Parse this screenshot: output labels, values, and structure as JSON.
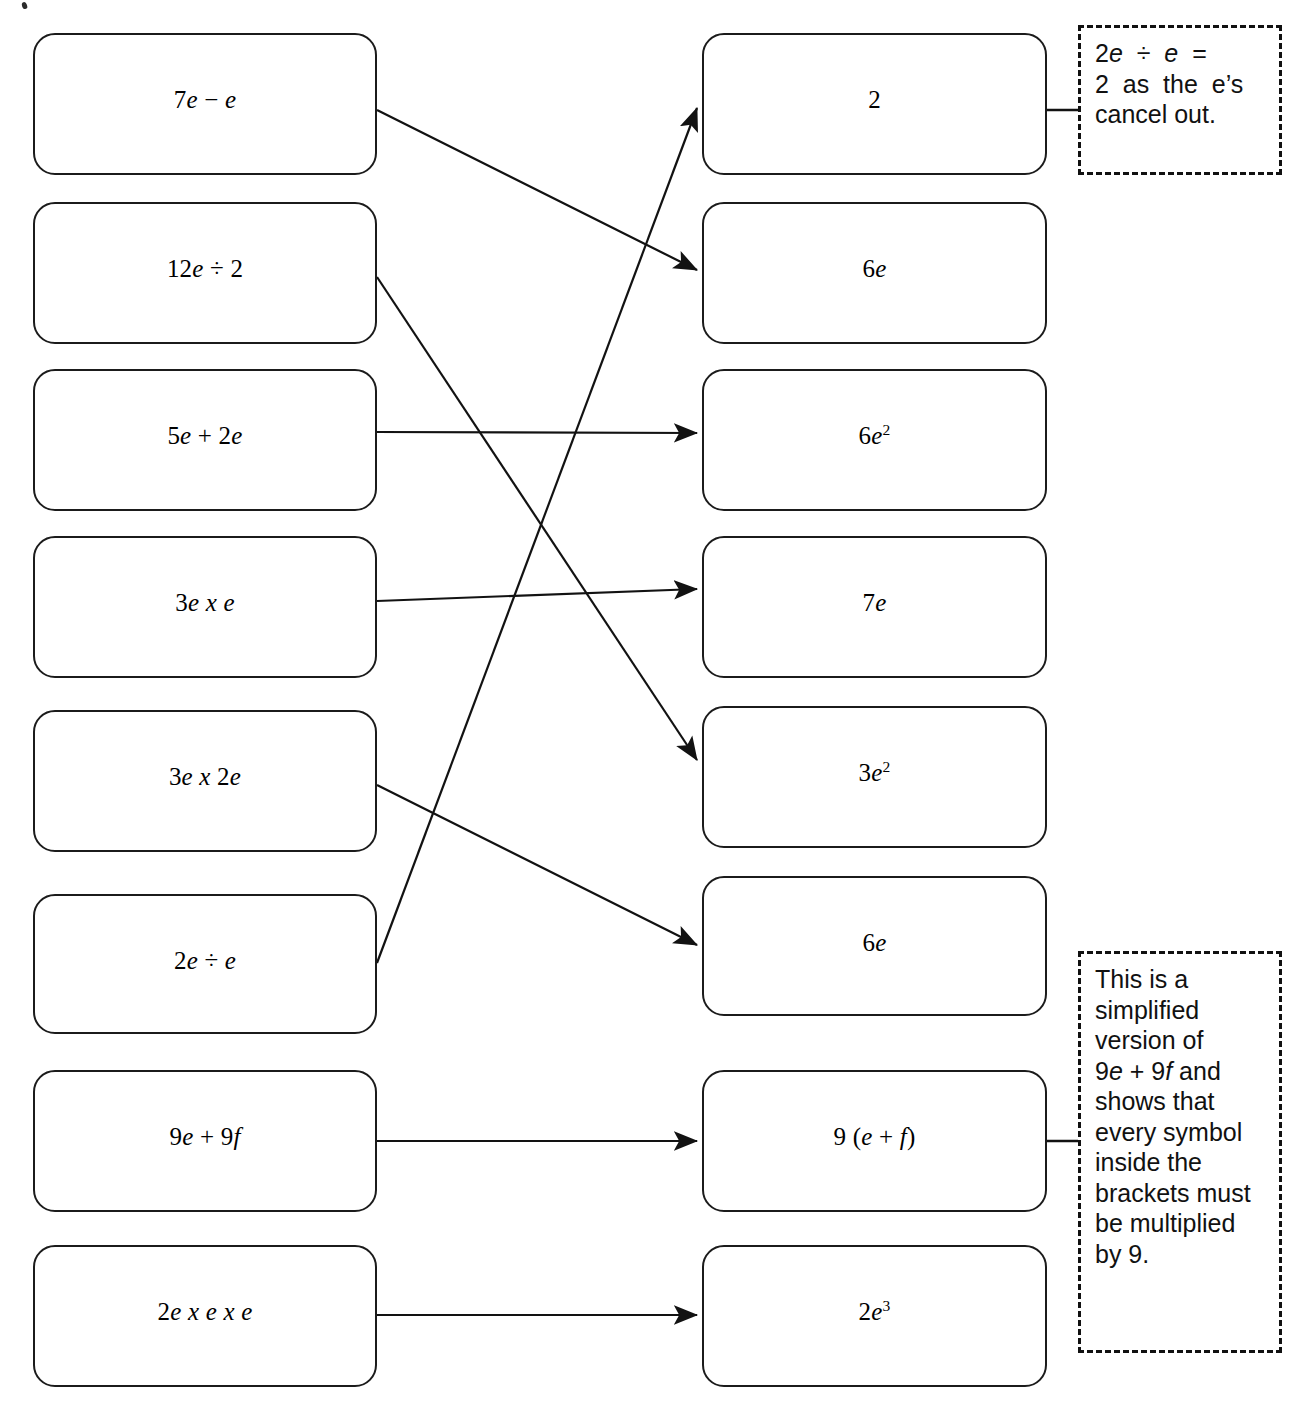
{
  "worksheet": {
    "left_column": [
      {
        "id": "l1",
        "text": "7e − e",
        "html": "7<i>e</i> − <i>e</i>"
      },
      {
        "id": "l2",
        "text": "12e ÷ 2",
        "html": "12<i>e</i> ÷ 2"
      },
      {
        "id": "l3",
        "text": "5e + 2e",
        "html": "5<i>e</i> + 2<i>e</i>"
      },
      {
        "id": "l4",
        "text": "3e x e",
        "html": "3<i>e</i> <i>x</i> <i>e</i>"
      },
      {
        "id": "l5",
        "text": "3e x 2e",
        "html": "3<i>e</i> <i>x</i> 2<i>e</i>"
      },
      {
        "id": "l6",
        "text": "2e ÷ e",
        "html": "2<i>e</i> ÷ <i>e</i>"
      },
      {
        "id": "l7",
        "text": "9e + 9f",
        "html": "9<i>e</i> + 9<i>f</i>"
      },
      {
        "id": "l8",
        "text": "2e x e x e",
        "html": "2<i>e</i> <i>x</i> <i>e</i> <i>x</i> <i>e</i>"
      }
    ],
    "right_column": [
      {
        "id": "r1",
        "text": "2",
        "html": "2"
      },
      {
        "id": "r2",
        "text": "6e",
        "html": "6<i>e</i>"
      },
      {
        "id": "r3",
        "text": "6e2",
        "html": "6<i>e</i><sup>2</sup>"
      },
      {
        "id": "r4",
        "text": "7e",
        "html": "7<i>e</i>"
      },
      {
        "id": "r5",
        "text": "3e2",
        "html": "3<i>e</i><sup>2</sup>"
      },
      {
        "id": "r6",
        "text": "6e",
        "html": "6<i>e</i>"
      },
      {
        "id": "r7",
        "text": "9 (e + f)",
        "html": "9 (<i>e</i> + <i>f</i>)"
      },
      {
        "id": "r8",
        "text": "2e3",
        "html": "2<i>e</i><sup>3</sup>"
      }
    ],
    "notes": [
      {
        "id": "note-top",
        "attached_to": "r1",
        "text": "2e ÷ e = 2 as the e's cancel out.",
        "lines": [
          {
            "html": "2<i>e</i>  ÷  <i>e</i>  ="
          },
          {
            "html": "2  as  the  e’s"
          },
          {
            "html": "cancel out."
          }
        ]
      },
      {
        "id": "note-bottom",
        "attached_to": "r7",
        "text": "This is a simplified version of 9e + 9f and shows that every symbol inside the brackets must be multiplied by 9.",
        "lines": [
          {
            "html": "This is a"
          },
          {
            "html": "simplified"
          },
          {
            "html": "version of"
          },
          {
            "html": "9<i>e</i> + 9<i>f</i> and"
          },
          {
            "html": "shows that"
          },
          {
            "html": "every symbol"
          },
          {
            "html": "inside the"
          },
          {
            "html": "brackets must"
          },
          {
            "html": "be multiplied"
          },
          {
            "html": "by 9."
          }
        ]
      }
    ],
    "connections": [
      {
        "from": "l1",
        "to": "r2",
        "label": "7e − e → 6e"
      },
      {
        "from": "l2",
        "to": "r5",
        "label": "12e ÷ 2 → 3e2"
      },
      {
        "from": "l3",
        "to": "r3",
        "label": "5e + 2e → 6e2"
      },
      {
        "from": "l4",
        "to": "r4",
        "label": "3e x e → 7e"
      },
      {
        "from": "l5",
        "to": "r6",
        "label": "3e x 2e → 6e"
      },
      {
        "from": "l6",
        "to": "r1",
        "label": "2e ÷ e → 2"
      },
      {
        "from": "l7",
        "to": "r7",
        "label": "9e + 9f → 9 (e + f)"
      },
      {
        "from": "l8",
        "to": "r8",
        "label": "2e x e x e → 2e3"
      }
    ],
    "colors": {
      "ink": "#1b1b1b",
      "paper": "#ffffff",
      "note_border": "#111111"
    }
  }
}
